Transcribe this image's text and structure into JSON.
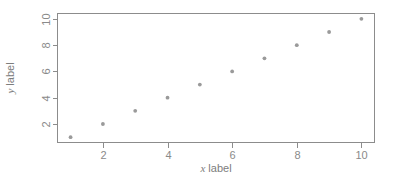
{
  "chart_data": {
    "type": "scatter",
    "title": "",
    "subtitle": "",
    "xlabel_var": "x",
    "xlabel_text": " label",
    "ylabel_var": "y",
    "ylabel_text": " label",
    "x": [
      1,
      2,
      3,
      4,
      5,
      6,
      7,
      8,
      9,
      10
    ],
    "values": [
      1,
      2,
      3,
      4,
      5,
      6,
      7,
      8,
      9,
      10
    ],
    "series": [
      {
        "name": "series-1",
        "points": [
          {
            "x": 1,
            "y": 1
          },
          {
            "x": 2,
            "y": 2
          },
          {
            "x": 3,
            "y": 3
          },
          {
            "x": 4,
            "y": 4
          },
          {
            "x": 5,
            "y": 5
          },
          {
            "x": 6,
            "y": 6
          },
          {
            "x": 7,
            "y": 7
          },
          {
            "x": 8,
            "y": 8
          },
          {
            "x": 9,
            "y": 9
          },
          {
            "x": 10,
            "y": 10
          }
        ]
      }
    ],
    "xlim": [
      0.595,
      10.405
    ],
    "ylim": [
      0.595,
      10.405
    ],
    "xticks": [
      2,
      4,
      6,
      8,
      10
    ],
    "yticks": [
      2,
      4,
      6,
      8,
      10
    ],
    "xtick_labels": [
      "2",
      "4",
      "6",
      "8",
      "10"
    ],
    "ytick_labels": [
      "2",
      "4",
      "6",
      "8",
      "10"
    ],
    "grid": false,
    "legend": false,
    "legend_position": "none",
    "marker": "filled-circle",
    "marker_color": "#9a9a9a",
    "axis_color": "#8c8c8c",
    "text_color": "#7d7d7d",
    "background": "#ffffff",
    "ytick_label_rotation": -90,
    "ylabel_rotation": -90,
    "box_style": "full-rectangle"
  }
}
